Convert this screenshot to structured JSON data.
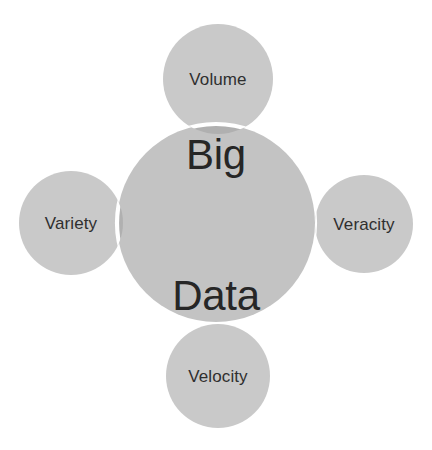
{
  "diagram": {
    "type": "venn-cluster",
    "title": "Big Data",
    "background_color": "#ffffff",
    "core": {
      "id": "big-data",
      "label_line_1": "Big",
      "label_line_2": "Data",
      "label_full": "Big Data",
      "cx": 216,
      "cy": 223,
      "r": 99,
      "fill": "#c3c3c3",
      "text_color": "#262626",
      "font_size": 42
    },
    "satellites": [
      {
        "id": "volume",
        "label": "Volume",
        "position": "top",
        "cx": 218,
        "cy": 79,
        "r": 55,
        "fill": "#c9c9c9",
        "overlap_fill": "#b0b0b0",
        "stroke": "#ffffff",
        "text_color": "#2f2f2f",
        "font_size": 17
      },
      {
        "id": "variety",
        "label": "Variety",
        "position": "left",
        "cx": 71,
        "cy": 223,
        "r": 52,
        "fill": "#c9c9c9",
        "overlap_fill": "#b0b0b0",
        "stroke": "#ffffff",
        "text_color": "#2f2f2f",
        "font_size": 17
      },
      {
        "id": "veracity",
        "label": "Veracity",
        "position": "right",
        "cx": 364,
        "cy": 224,
        "r": 49,
        "fill": "#c9c9c9",
        "overlap_fill": "#b0b0b0",
        "stroke": "#ffffff",
        "text_color": "#2f2f2f",
        "font_size": 17
      },
      {
        "id": "velocity",
        "label": "Velocity",
        "position": "bottom",
        "cx": 218,
        "cy": 376,
        "r": 52,
        "fill": "#c9c9c9",
        "overlap_fill": "#b0b0b0",
        "stroke": "#ffffff",
        "text_color": "#2f2f2f",
        "font_size": 17
      }
    ],
    "colors": {
      "core_grey": "#c3c3c3",
      "satellite_grey": "#c9c9c9",
      "overlap_grey": "#b0b0b0",
      "separator_white": "#ffffff",
      "text_dark": "#2b2b2b"
    }
  }
}
